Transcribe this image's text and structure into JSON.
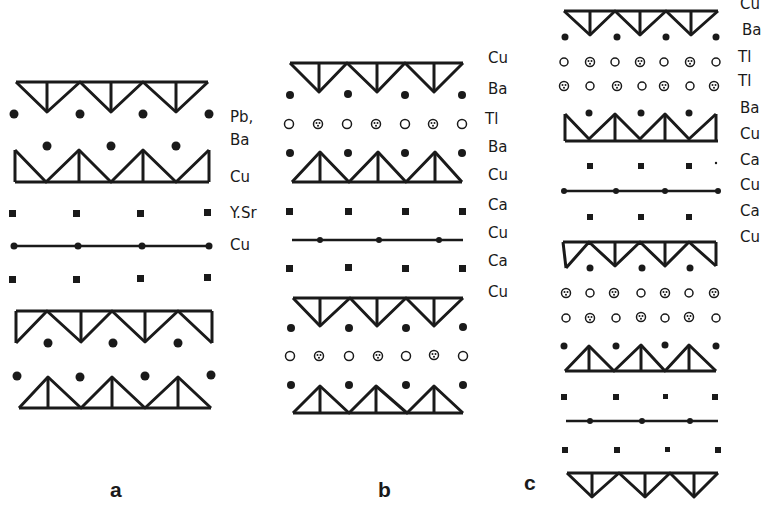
{
  "figure": {
    "panels": [
      {
        "id": "a",
        "label": "a",
        "layer_labels": [
          "Pb,",
          "Ba",
          "Cu",
          "Y.Sr",
          "Cu"
        ]
      },
      {
        "id": "b",
        "label": "b",
        "layer_labels": [
          "Cu",
          "Ba",
          "Tl",
          "Ba",
          "Cu",
          "Ca",
          "Cu",
          "Ca",
          "Cu"
        ]
      },
      {
        "id": "c",
        "label": "c",
        "layer_labels": [
          "Cu",
          "Ba",
          "Tl",
          "Tl",
          "Ba",
          "Cu",
          "Ca",
          "Cu",
          "Ca",
          "Cu"
        ]
      }
    ],
    "colors": {
      "ink": "#1a1a1a",
      "background": "#ffffff"
    }
  }
}
